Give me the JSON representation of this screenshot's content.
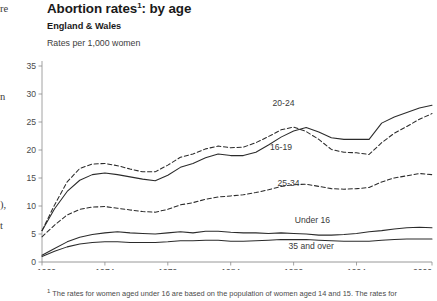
{
  "page": {
    "background": "#ffffff",
    "bleed_fragments": [
      "re",
      "n",
      "),",
      "t"
    ]
  },
  "header": {
    "title": "Abortion rates",
    "title_footnote_marker": "1",
    "title_suffix": ": by age",
    "subtitle": "England & Wales",
    "units": "Rates per 1,000 women"
  },
  "footnote": {
    "marker": "1",
    "text": "The rates for women aged under 16 are based on the population of women aged 14 and 15. The rates for"
  },
  "colors": {
    "line": "#2b2b2b",
    "axis": "#8c8c8c",
    "text": "#231f20",
    "tick_text": "#4a4a4a"
  },
  "chart_data": {
    "type": "line",
    "subtitle": "England & Wales",
    "xlabel": "",
    "ylabel": "Rates per 1,000 women",
    "xlim": [
      1969,
      2000
    ],
    "ylim": [
      0,
      35
    ],
    "yticks": [
      0,
      5,
      10,
      15,
      20,
      25,
      30,
      35
    ],
    "xticks": [
      1969,
      1974,
      1979,
      1984,
      1989,
      1994,
      2000
    ],
    "grid": false,
    "legend_position": "inline-labels",
    "x": [
      1969,
      1970,
      1971,
      1972,
      1973,
      1974,
      1975,
      1976,
      1977,
      1978,
      1979,
      1980,
      1981,
      1982,
      1983,
      1984,
      1985,
      1986,
      1987,
      1988,
      1989,
      1990,
      1991,
      1992,
      1993,
      1994,
      1995,
      1996,
      1997,
      1998,
      1999,
      2000
    ],
    "series": [
      {
        "name": "20-24",
        "style": "solid",
        "label_x": 1988.2,
        "label_y": 27.8,
        "values": [
          5.6,
          9.5,
          12.6,
          14.6,
          15.6,
          15.9,
          15.6,
          15.2,
          14.8,
          14.5,
          15.5,
          16.9,
          17.6,
          18.6,
          19.3,
          19.0,
          19.0,
          19.6,
          20.9,
          22.3,
          23.4,
          24.0,
          23.2,
          22.2,
          21.9,
          21.9,
          21.9,
          24.8,
          25.9,
          26.7,
          27.5,
          28.0
        ],
        "values_note": "read off axis, rates per 1,000 women"
      },
      {
        "name": "16-19",
        "style": "dashed",
        "label_x": 1988.0,
        "label_y": 20.0,
        "values": [
          5.6,
          10.2,
          14.3,
          16.7,
          17.5,
          17.6,
          17.2,
          16.6,
          16.1,
          16.1,
          17.3,
          18.7,
          19.3,
          20.2,
          20.7,
          20.4,
          20.5,
          21.3,
          22.4,
          23.6,
          24.1,
          23.3,
          21.9,
          20.1,
          19.6,
          19.5,
          19.2,
          21.3,
          23.0,
          24.2,
          25.5,
          26.5
        ],
        "values_note": "read off axis, rates per 1,000 women"
      },
      {
        "name": "25-34",
        "style": "dashed",
        "label_x": 1988.6,
        "label_y": 13.5,
        "values": [
          4.5,
          6.6,
          8.4,
          9.4,
          9.8,
          9.9,
          9.6,
          9.3,
          9.0,
          8.9,
          9.4,
          10.2,
          10.6,
          11.2,
          11.6,
          11.8,
          12.0,
          12.4,
          12.9,
          13.5,
          13.8,
          13.9,
          13.5,
          13.1,
          13.0,
          13.1,
          13.3,
          14.3,
          15.0,
          15.4,
          15.8,
          15.6
        ],
        "values_note": "read off axis, rates per 1,000 women"
      },
      {
        "name": "Under 16",
        "style": "solid",
        "label_x": 1990.5,
        "label_y": 6.9,
        "values": [
          1.2,
          2.4,
          3.6,
          4.4,
          4.9,
          5.2,
          5.4,
          5.2,
          5.1,
          5.0,
          5.2,
          5.4,
          5.2,
          5.5,
          5.5,
          5.3,
          5.2,
          5.2,
          5.1,
          5.2,
          5.1,
          5.0,
          4.8,
          4.8,
          4.9,
          5.1,
          5.4,
          5.6,
          5.9,
          6.1,
          6.2,
          6.1
        ],
        "values_note": "based on population of women aged 14 and 15"
      },
      {
        "name": "35 and over",
        "style": "solid",
        "label_x": 1990.4,
        "label_y": 2.3,
        "values": [
          1.0,
          1.9,
          2.7,
          3.2,
          3.5,
          3.6,
          3.6,
          3.5,
          3.5,
          3.5,
          3.6,
          3.8,
          3.8,
          3.9,
          3.9,
          3.7,
          3.7,
          3.8,
          3.9,
          4.0,
          4.0,
          4.0,
          3.9,
          3.8,
          3.7,
          3.7,
          3.7,
          3.9,
          4.0,
          4.1,
          4.1,
          4.1
        ],
        "values_note": "read off axis, rates per 1,000 women"
      }
    ]
  }
}
